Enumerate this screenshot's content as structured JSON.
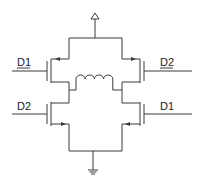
{
  "diagram": {
    "type": "H-bridge circuit",
    "supply_symbol": "vdd",
    "ground_symbol": "ground",
    "load": "inductor",
    "transistors": [
      {
        "position": "top-left",
        "gate_label": "D1"
      },
      {
        "position": "top-right",
        "gate_label": "D2"
      },
      {
        "position": "bottom-left",
        "gate_label": "D2"
      },
      {
        "position": "bottom-right",
        "gate_label": "D1"
      }
    ]
  },
  "labels": {
    "top_left": "D1",
    "top_right": "D2",
    "bottom_left": "D2",
    "bottom_right": "D1"
  },
  "colors": {
    "wire": "#3a3a3a",
    "text": "#222222",
    "background": "#ffffff"
  }
}
